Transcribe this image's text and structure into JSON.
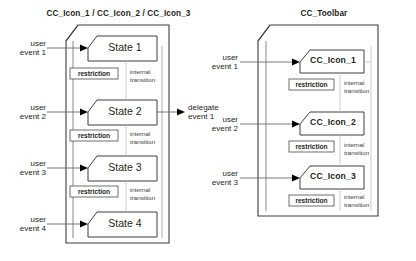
{
  "page": {
    "background_color": "#ffffff",
    "stroke_color": "#3f3f3f",
    "light_stroke_color": "#b9b9b9",
    "text_color": "#231f20"
  },
  "panels": [
    {
      "id": "states-panel",
      "title": "CC_Icon_1 / CC_Icon_2 / CC_Icon_3",
      "inputs": [
        {
          "line1": "user",
          "line2": "event 1"
        },
        {
          "line1": "user",
          "line2": "event 2"
        },
        {
          "line1": "user",
          "line2": "event 3"
        },
        {
          "line1": "user",
          "line2": "event 4"
        }
      ],
      "states": [
        {
          "name": "State 1",
          "bold": false
        },
        {
          "name": "State 2",
          "bold": false
        },
        {
          "name": "State 3",
          "bold": false
        },
        {
          "name": "State 4",
          "bold": false
        }
      ],
      "transitions": [
        {
          "restriction": "restriction",
          "internal_l1": "internal",
          "internal_l2": "transition"
        },
        {
          "restriction": "restriction",
          "internal_l1": "internal",
          "internal_l2": "transition"
        },
        {
          "restriction": "restriction",
          "internal_l1": "internal",
          "internal_l2": "transition"
        }
      ],
      "outputs": [
        {
          "line1": "delegate",
          "line2": "event 1"
        }
      ]
    },
    {
      "id": "toolbar-panel",
      "title": "CC_Toolbar",
      "inputs": [
        {
          "line1": "user",
          "line2": "event 1"
        },
        {
          "line1": "user",
          "line2": "event 2"
        },
        {
          "line1": "user",
          "line2": "event 3"
        }
      ],
      "states": [
        {
          "name": "CC_Icon_1",
          "bold": true
        },
        {
          "name": "CC_Icon_2",
          "bold": true
        },
        {
          "name": "CC_Icon_3",
          "bold": true
        }
      ],
      "transitions": [
        {
          "restriction": "restriction",
          "internal_l1": "internal",
          "internal_l2": "transition"
        },
        {
          "restriction": "restriction",
          "internal_l1": "internal",
          "internal_l2": "transition"
        },
        {
          "restriction": "restriction",
          "internal_l1": "internal",
          "internal_l2": "transition"
        }
      ],
      "outputs": []
    }
  ]
}
